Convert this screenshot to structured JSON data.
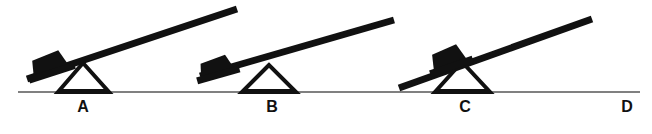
{
  "figure": {
    "background_color": "#ffffff",
    "ink_color": "#111111",
    "ground_color": "#808080",
    "ground": {
      "x1": 18,
      "x2": 640,
      "y": 92,
      "thickness": 2
    },
    "labels": [
      {
        "id": "label-a",
        "text": "A",
        "x": 70,
        "y": 98
      },
      {
        "id": "label-b",
        "text": "B",
        "x": 259,
        "y": 98
      },
      {
        "id": "label-c",
        "text": "C",
        "x": 452,
        "y": 98
      },
      {
        "id": "label-d",
        "text": "D",
        "x": 614,
        "y": 98
      }
    ],
    "levers": [
      {
        "id": "lever-a",
        "label": "A",
        "beam": {
          "x1": 27,
          "y1": 79,
          "x2": 237,
          "y2": 9,
          "thickness": 7
        },
        "fulcrum": {
          "left_x": 58,
          "right_x": 109,
          "apex_x": 83,
          "apex_y": 63,
          "base_y": 92,
          "stroke": 4
        },
        "block": {
          "center_x": 48,
          "center_y": 64,
          "width": 46,
          "height": 20,
          "rotation_deg": -18
        }
      },
      {
        "id": "lever-b",
        "label": "B",
        "beam": {
          "x1": 200,
          "y1": 76,
          "x2": 394,
          "y2": 20,
          "thickness": 7
        },
        "fulcrum": {
          "left_x": 242,
          "right_x": 296,
          "apex_x": 269,
          "apex_y": 65,
          "base_y": 92,
          "stroke": 4
        },
        "block": {
          "center_x": 215,
          "center_y": 67,
          "width": 40,
          "height": 18,
          "rotation_deg": -16
        }
      },
      {
        "id": "lever-c",
        "label": "C",
        "beam": {
          "x1": 399,
          "y1": 88,
          "x2": 592,
          "y2": 19,
          "thickness": 7
        },
        "fulcrum": {
          "left_x": 435,
          "right_x": 490,
          "apex_x": 462,
          "apex_y": 62,
          "base_y": 92,
          "stroke": 4
        },
        "block": {
          "center_x": 447,
          "center_y": 58,
          "width": 42,
          "height": 19,
          "rotation_deg": -19
        }
      }
    ]
  }
}
